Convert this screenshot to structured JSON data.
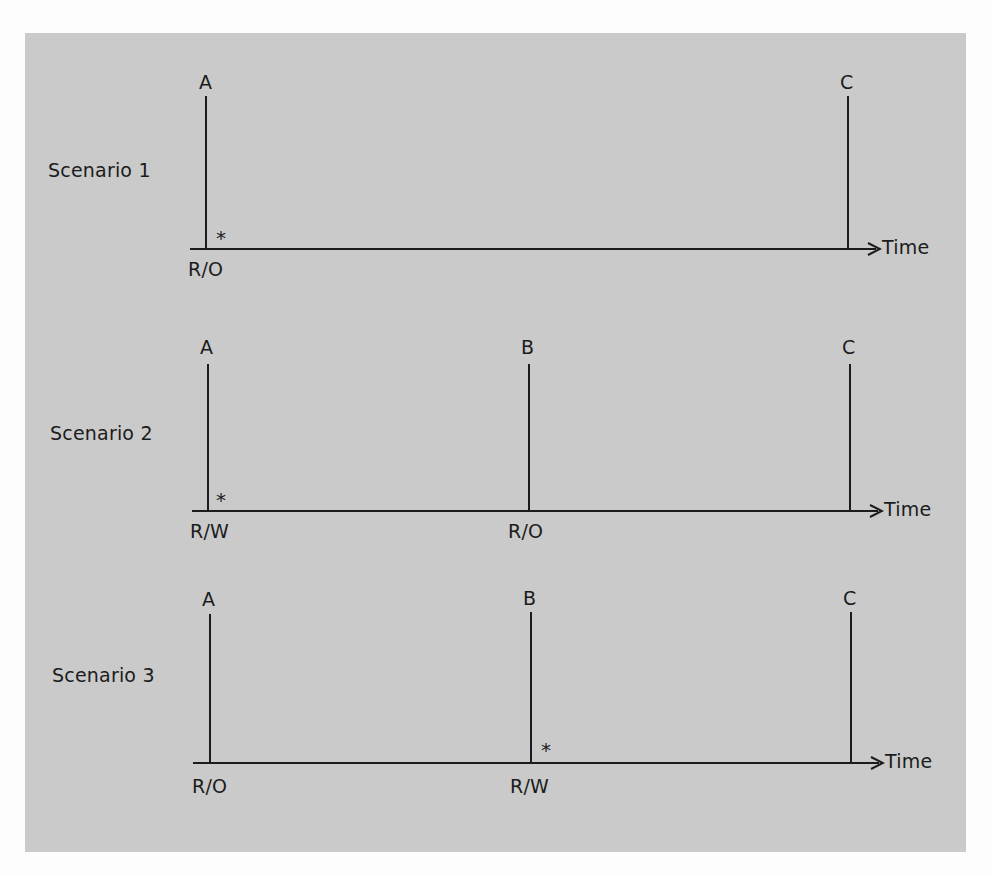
{
  "colors": {
    "panel": "#cacaca",
    "ink": "#1c1c1c",
    "page": "#fdfdfd"
  },
  "axis_label": "Time",
  "marker": "*",
  "scenarios": [
    {
      "label": "Scenario 1",
      "points": [
        {
          "name": "A",
          "mode": "R/O",
          "star": true
        },
        {
          "name": "C",
          "mode": "",
          "star": false
        }
      ]
    },
    {
      "label": "Scenario 2",
      "points": [
        {
          "name": "A",
          "mode": "R/W",
          "star": true
        },
        {
          "name": "B",
          "mode": "R/O",
          "star": false
        },
        {
          "name": "C",
          "mode": "",
          "star": false
        }
      ]
    },
    {
      "label": "Scenario 3",
      "points": [
        {
          "name": "A",
          "mode": "R/O",
          "star": false
        },
        {
          "name": "B",
          "mode": "R/W",
          "star": true
        },
        {
          "name": "C",
          "mode": "",
          "star": false
        }
      ]
    }
  ]
}
